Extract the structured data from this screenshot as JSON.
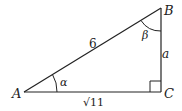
{
  "diagram": {
    "type": "right-triangle",
    "vertices": {
      "A": {
        "label": "A",
        "x": 24,
        "y": 92
      },
      "B": {
        "label": "B",
        "x": 161,
        "y": 8
      },
      "C": {
        "label": "C",
        "x": 161,
        "y": 92
      }
    },
    "sides": {
      "AB": {
        "label": "6"
      },
      "AC": {
        "label": "√11"
      },
      "BC": {
        "label": "a"
      }
    },
    "angles": {
      "A": {
        "label": "α"
      },
      "B": {
        "label": "β"
      },
      "C": {
        "right_angle": true
      }
    },
    "colors": {
      "stroke": "#222222",
      "background": "#ffffff"
    }
  }
}
